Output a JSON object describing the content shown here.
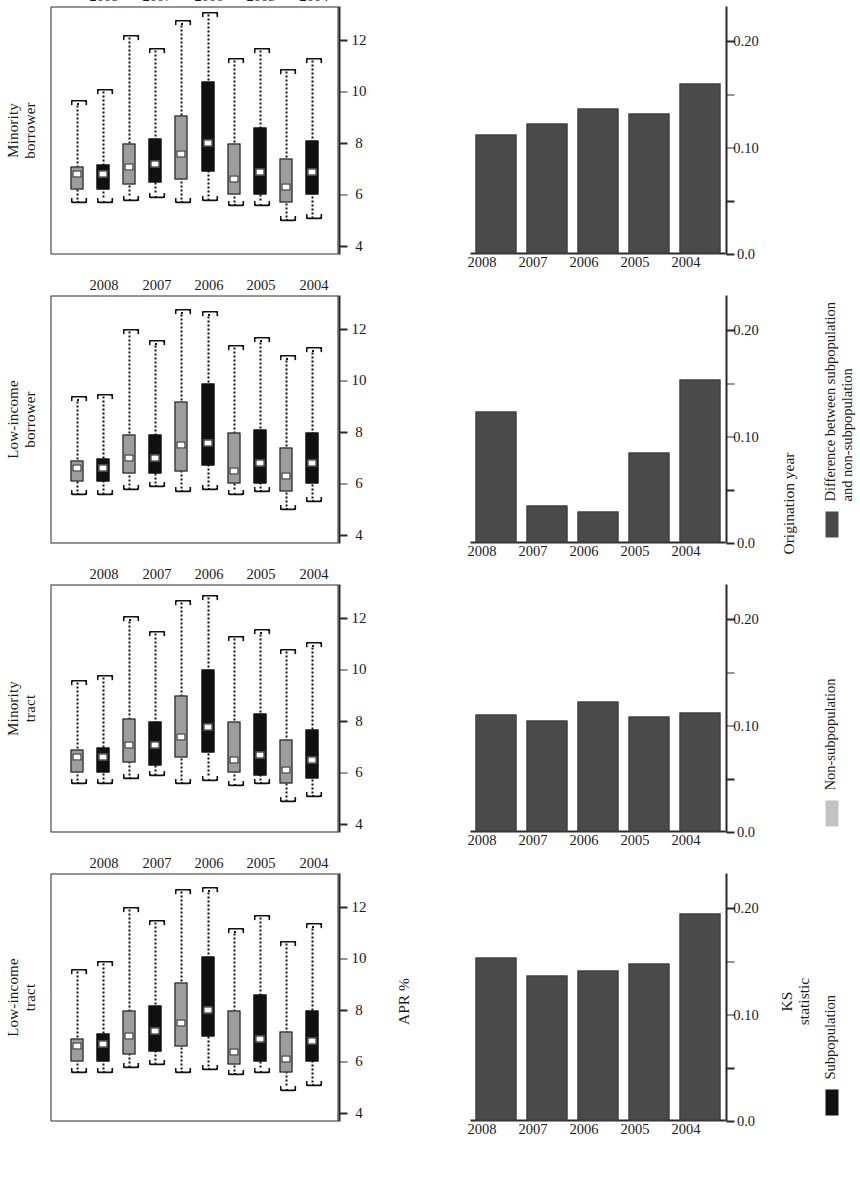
{
  "figure": {
    "orientation": "rotated-90-ccw",
    "shared_x_axis_title": "Origination year",
    "box_y_axis_title": "APR %",
    "bar_y_axis_title_line1": "KS",
    "bar_y_axis_title_line2": "statistic",
    "years": [
      "2004",
      "2005",
      "2006",
      "2007",
      "2008"
    ]
  },
  "colors": {
    "subpopulation": "#111111",
    "non_subpopulation": "#9d9d9d",
    "difference": "#4a4a4a",
    "axis": "#2a2a2a",
    "background": "#ffffff"
  },
  "legend": {
    "items": [
      {
        "swatch": "sub",
        "label": "Subpopulation"
      },
      {
        "swatch": "non",
        "label": "Non-subpopulation"
      },
      {
        "swatch": "diff",
        "label_line1": "Difference between subpopulation",
        "label_line2": "and non-subpopulation"
      }
    ]
  },
  "panels": [
    {
      "id": "low-income-tract",
      "title_line1": "Low-income",
      "title_line2": "tract"
    },
    {
      "id": "minority-tract",
      "title_line1": "Minority",
      "title_line2": "tract"
    },
    {
      "id": "low-income-borrower",
      "title_line1": "Low-income",
      "title_line2": "borrower"
    },
    {
      "id": "minority-borrower",
      "title_line1": "Minority",
      "title_line2": "borrower"
    }
  ],
  "chart_data": [
    {
      "type": "box",
      "panel": "Low-income tract",
      "title": "Low-income tract",
      "xlabel": "Origination year",
      "ylabel": "APR %",
      "ylim": [
        4,
        13
      ],
      "yticks": [
        12,
        10,
        8,
        6,
        4
      ],
      "categories": [
        "2004",
        "2005",
        "2006",
        "2007",
        "2008"
      ],
      "legend_position": "bottom",
      "grid": false,
      "series": [
        {
          "name": "Subpopulation",
          "color": "#111111",
          "boxes": [
            {
              "year": "2004",
              "whisker_low": 5.1,
              "q1": 6.0,
              "median": 6.8,
              "q3": 8.0,
              "whisker_high": 11.3
            },
            {
              "year": "2005",
              "whisker_low": 5.6,
              "q1": 6.0,
              "median": 6.9,
              "q3": 8.6,
              "whisker_high": 11.6
            },
            {
              "year": "2006",
              "whisker_low": 5.7,
              "q1": 7.0,
              "median": 8.0,
              "q3": 10.1,
              "whisker_high": 12.7
            },
            {
              "year": "2007",
              "whisker_low": 5.9,
              "q1": 6.4,
              "median": 7.2,
              "q3": 8.2,
              "whisker_high": 11.4
            },
            {
              "year": "2008",
              "whisker_low": 5.6,
              "q1": 6.0,
              "median": 6.7,
              "q3": 7.1,
              "whisker_high": 9.8
            }
          ]
        },
        {
          "name": "Non-subpopulation",
          "color": "#9d9d9d",
          "boxes": [
            {
              "year": "2004",
              "whisker_low": 4.9,
              "q1": 5.6,
              "median": 6.1,
              "q3": 7.2,
              "whisker_high": 10.6
            },
            {
              "year": "2005",
              "whisker_low": 5.5,
              "q1": 5.9,
              "median": 6.4,
              "q3": 8.0,
              "whisker_high": 11.1
            },
            {
              "year": "2006",
              "whisker_low": 5.6,
              "q1": 6.6,
              "median": 7.5,
              "q3": 9.1,
              "whisker_high": 12.6
            },
            {
              "year": "2007",
              "whisker_low": 5.8,
              "q1": 6.3,
              "median": 7.0,
              "q3": 8.0,
              "whisker_high": 11.9
            },
            {
              "year": "2008",
              "whisker_low": 5.6,
              "q1": 6.0,
              "median": 6.6,
              "q3": 6.9,
              "whisker_high": 9.5
            }
          ]
        }
      ]
    },
    {
      "type": "box",
      "panel": "Minority tract",
      "title": "Minority tract",
      "xlabel": "Origination year",
      "ylabel": "APR %",
      "ylim": [
        4,
        13
      ],
      "yticks": [
        12,
        10,
        8,
        6,
        4
      ],
      "categories": [
        "2004",
        "2005",
        "2006",
        "2007",
        "2008"
      ],
      "grid": false,
      "series": [
        {
          "name": "Subpopulation",
          "color": "#111111",
          "boxes": [
            {
              "year": "2004",
              "whisker_low": 5.1,
              "q1": 5.8,
              "median": 6.5,
              "q3": 7.7,
              "whisker_high": 11.0
            },
            {
              "year": "2005",
              "whisker_low": 5.6,
              "q1": 5.9,
              "median": 6.7,
              "q3": 8.3,
              "whisker_high": 11.5
            },
            {
              "year": "2006",
              "whisker_low": 5.7,
              "q1": 6.8,
              "median": 7.8,
              "q3": 10.0,
              "whisker_high": 12.8
            },
            {
              "year": "2007",
              "whisker_low": 5.9,
              "q1": 6.3,
              "median": 7.1,
              "q3": 8.0,
              "whisker_high": 11.4
            },
            {
              "year": "2008",
              "whisker_low": 5.6,
              "q1": 6.0,
              "median": 6.6,
              "q3": 7.0,
              "whisker_high": 9.7
            }
          ]
        },
        {
          "name": "Non-subpopulation",
          "color": "#9d9d9d",
          "boxes": [
            {
              "year": "2004",
              "whisker_low": 4.9,
              "q1": 5.6,
              "median": 6.1,
              "q3": 7.3,
              "whisker_high": 10.7
            },
            {
              "year": "2005",
              "whisker_low": 5.5,
              "q1": 6.0,
              "median": 6.5,
              "q3": 8.0,
              "whisker_high": 11.2
            },
            {
              "year": "2006",
              "whisker_low": 5.6,
              "q1": 6.6,
              "median": 7.4,
              "q3": 9.0,
              "whisker_high": 12.6
            },
            {
              "year": "2007",
              "whisker_low": 5.8,
              "q1": 6.4,
              "median": 7.1,
              "q3": 8.1,
              "whisker_high": 12.0
            },
            {
              "year": "2008",
              "whisker_low": 5.6,
              "q1": 6.0,
              "median": 6.6,
              "q3": 6.9,
              "whisker_high": 9.5
            }
          ]
        }
      ]
    },
    {
      "type": "box",
      "panel": "Low-income borrower",
      "title": "Low-income borrower",
      "xlabel": "Origination year",
      "ylabel": "APR %",
      "ylim": [
        4,
        13
      ],
      "yticks": [
        12,
        10,
        8,
        6,
        4
      ],
      "categories": [
        "2004",
        "2005",
        "2006",
        "2007",
        "2008"
      ],
      "grid": false,
      "series": [
        {
          "name": "Subpopulation",
          "color": "#111111",
          "boxes": [
            {
              "year": "2004",
              "whisker_low": 5.3,
              "q1": 6.0,
              "median": 6.8,
              "q3": 8.0,
              "whisker_high": 11.2
            },
            {
              "year": "2005",
              "whisker_low": 5.7,
              "q1": 6.0,
              "median": 6.8,
              "q3": 8.1,
              "whisker_high": 11.6
            },
            {
              "year": "2006",
              "whisker_low": 5.8,
              "q1": 6.7,
              "median": 7.6,
              "q3": 9.9,
              "whisker_high": 12.6
            },
            {
              "year": "2007",
              "whisker_low": 5.9,
              "q1": 6.4,
              "median": 7.0,
              "q3": 7.9,
              "whisker_high": 11.5
            },
            {
              "year": "2008",
              "whisker_low": 5.6,
              "q1": 6.1,
              "median": 6.6,
              "q3": 7.0,
              "whisker_high": 9.4
            }
          ]
        },
        {
          "name": "Non-subpopulation",
          "color": "#9d9d9d",
          "boxes": [
            {
              "year": "2004",
              "whisker_low": 5.0,
              "q1": 5.7,
              "median": 6.3,
              "q3": 7.4,
              "whisker_high": 10.9
            },
            {
              "year": "2005",
              "whisker_low": 5.6,
              "q1": 6.0,
              "median": 6.5,
              "q3": 8.0,
              "whisker_high": 11.3
            },
            {
              "year": "2006",
              "whisker_low": 5.7,
              "q1": 6.5,
              "median": 7.5,
              "q3": 9.2,
              "whisker_high": 12.7
            },
            {
              "year": "2007",
              "whisker_low": 5.8,
              "q1": 6.4,
              "median": 7.0,
              "q3": 7.9,
              "whisker_high": 11.9
            },
            {
              "year": "2008",
              "whisker_low": 5.6,
              "q1": 6.1,
              "median": 6.6,
              "q3": 6.9,
              "whisker_high": 9.3
            }
          ]
        }
      ]
    },
    {
      "type": "box",
      "panel": "Minority borrower",
      "title": "Minority borrower",
      "xlabel": "Origination year",
      "ylabel": "APR %",
      "ylim": [
        4,
        13
      ],
      "yticks": [
        12,
        10,
        8,
        6,
        4
      ],
      "categories": [
        "2004",
        "2005",
        "2006",
        "2007",
        "2008"
      ],
      "grid": false,
      "series": [
        {
          "name": "Subpopulation",
          "color": "#111111",
          "boxes": [
            {
              "year": "2004",
              "whisker_low": 5.1,
              "q1": 6.0,
              "median": 6.9,
              "q3": 8.1,
              "whisker_high": 11.2
            },
            {
              "year": "2005",
              "whisker_low": 5.6,
              "q1": 6.0,
              "median": 6.9,
              "q3": 8.6,
              "whisker_high": 11.6
            },
            {
              "year": "2006",
              "whisker_low": 5.8,
              "q1": 6.9,
              "median": 8.0,
              "q3": 10.4,
              "whisker_high": 13.0
            },
            {
              "year": "2007",
              "whisker_low": 5.9,
              "q1": 6.5,
              "median": 7.2,
              "q3": 8.2,
              "whisker_high": 11.6
            },
            {
              "year": "2008",
              "whisker_low": 5.7,
              "q1": 6.2,
              "median": 6.8,
              "q3": 7.2,
              "whisker_high": 10.0
            }
          ]
        },
        {
          "name": "Non-subpopulation",
          "color": "#9d9d9d",
          "boxes": [
            {
              "year": "2004",
              "whisker_low": 5.0,
              "q1": 5.7,
              "median": 6.3,
              "q3": 7.4,
              "whisker_high": 10.8
            },
            {
              "year": "2005",
              "whisker_low": 5.6,
              "q1": 6.0,
              "median": 6.6,
              "q3": 8.0,
              "whisker_high": 11.2
            },
            {
              "year": "2006",
              "whisker_low": 5.7,
              "q1": 6.6,
              "median": 7.6,
              "q3": 9.1,
              "whisker_high": 12.7
            },
            {
              "year": "2007",
              "whisker_low": 5.8,
              "q1": 6.4,
              "median": 7.1,
              "q3": 8.0,
              "whisker_high": 12.1
            },
            {
              "year": "2008",
              "whisker_low": 5.7,
              "q1": 6.2,
              "median": 6.8,
              "q3": 7.1,
              "whisker_high": 9.6
            }
          ]
        }
      ]
    },
    {
      "type": "bar",
      "panel": "Low-income tract",
      "title": "",
      "xlabel": "Origination year",
      "ylabel": "KS statistic",
      "ylim": [
        0.0,
        0.22
      ],
      "yticks": [
        0.0,
        0.05,
        0.1,
        0.15,
        0.2
      ],
      "ytick_labels": [
        "0.0",
        "",
        "0.10",
        "",
        "0.20"
      ],
      "categories": [
        "2004",
        "2005",
        "2006",
        "2007",
        "2008"
      ],
      "series_name": "Difference between subpopulation and non-subpopulation",
      "color": "#4a4a4a",
      "values": [
        0.195,
        0.148,
        0.141,
        0.136,
        0.153
      ]
    },
    {
      "type": "bar",
      "panel": "Minority tract",
      "title": "",
      "xlabel": "Origination year",
      "ylabel": "KS statistic",
      "ylim": [
        0.0,
        0.22
      ],
      "yticks": [
        0.0,
        0.05,
        0.1,
        0.15,
        0.2
      ],
      "ytick_labels": [
        "0.0",
        "",
        "0.10",
        "",
        "0.20"
      ],
      "categories": [
        "2004",
        "2005",
        "2006",
        "2007",
        "2008"
      ],
      "series_name": "Difference between subpopulation and non-subpopulation",
      "color": "#4a4a4a",
      "values": [
        0.112,
        0.108,
        0.122,
        0.104,
        0.11
      ]
    },
    {
      "type": "bar",
      "panel": "Low-income borrower",
      "title": "",
      "xlabel": "Origination year",
      "ylabel": "KS statistic",
      "ylim": [
        0.0,
        0.22
      ],
      "yticks": [
        0.0,
        0.05,
        0.1,
        0.15,
        0.2
      ],
      "ytick_labels": [
        "0.0",
        "",
        "0.10",
        "",
        "0.20"
      ],
      "categories": [
        "2004",
        "2005",
        "2006",
        "2007",
        "2008"
      ],
      "series_name": "Difference between subpopulation and non-subpopulation",
      "color": "#4a4a4a",
      "values": [
        0.153,
        0.085,
        0.029,
        0.035,
        0.123
      ]
    },
    {
      "type": "bar",
      "panel": "Minority borrower",
      "title": "",
      "xlabel": "Origination year",
      "ylabel": "KS statistic",
      "ylim": [
        0.0,
        0.22
      ],
      "yticks": [
        0.0,
        0.05,
        0.1,
        0.15,
        0.2
      ],
      "ytick_labels": [
        "0.0",
        "",
        "0.10",
        "",
        "0.20"
      ],
      "categories": [
        "2004",
        "2005",
        "2006",
        "2007",
        "2008"
      ],
      "series_name": "Difference between subpopulation and non-subpopulation",
      "color": "#4a4a4a",
      "values": [
        0.16,
        0.132,
        0.136,
        0.122,
        0.112
      ]
    }
  ]
}
